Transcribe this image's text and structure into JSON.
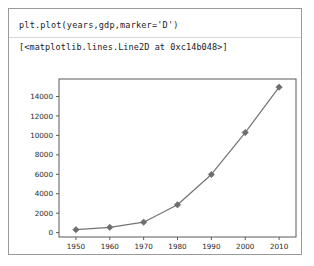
{
  "cell": {
    "code": "plt.plot(years,gdp,marker='D')",
    "output_repr": "[<matplotlib.lines.Line2D at 0xc14b048>]"
  },
  "colors": {
    "line": "#737373",
    "marker": "#6e6e6e",
    "axes_border": "#5a5a5a",
    "cell_border": "#9a9a9a",
    "text": "#1b1b1b",
    "background": "#ffffff"
  },
  "chart_data": {
    "type": "line",
    "title": "",
    "xlabel": "",
    "ylabel": "",
    "marker": "D",
    "grid": false,
    "legend": null,
    "x": [
      1950,
      1960,
      1970,
      1980,
      1990,
      2000,
      2010
    ],
    "values": [
      300.2,
      543.3,
      1075.9,
      2862.5,
      5979.6,
      10289.7,
      14958.3
    ],
    "xtick_labels": [
      "1950",
      "1960",
      "1970",
      "1980",
      "1990",
      "2000",
      "2010"
    ],
    "ytick_labels": [
      "0",
      "2000",
      "4000",
      "6000",
      "8000",
      "10000",
      "12000",
      "14000"
    ],
    "yticks": [
      0,
      2000,
      4000,
      6000,
      8000,
      10000,
      12000,
      14000
    ],
    "xlim": [
      1945,
      2015
    ],
    "ylim": [
      -450,
      15800
    ]
  }
}
